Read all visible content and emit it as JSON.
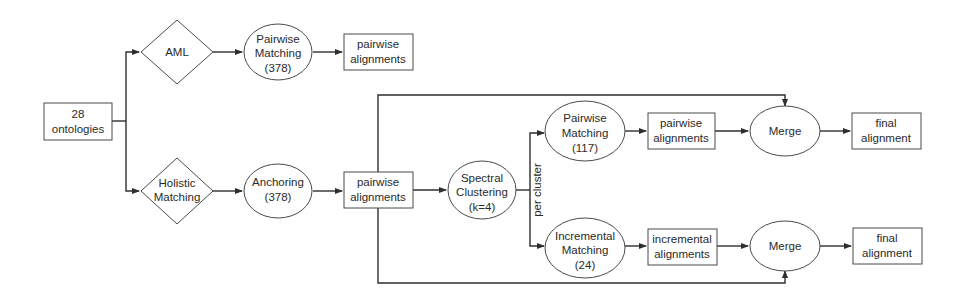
{
  "diagram": {
    "nodes": {
      "input": {
        "lines": [
          "28",
          "ontologies"
        ],
        "shape": "rect"
      },
      "aml": {
        "lines": [
          "AML"
        ],
        "shape": "diamond"
      },
      "pairwise_matching_378": {
        "lines": [
          "Pairwise",
          "Matching",
          "(378)"
        ],
        "shape": "ellipse"
      },
      "pairwise_alignments_top": {
        "lines": [
          "pairwise",
          "alignments"
        ],
        "shape": "rect"
      },
      "holistic": {
        "lines": [
          "Holistic",
          "Matching"
        ],
        "shape": "diamond"
      },
      "anchoring": {
        "lines": [
          "Anchoring",
          "(378)"
        ],
        "shape": "ellipse"
      },
      "pairwise_alignments_mid": {
        "lines": [
          "pairwise",
          "alignments"
        ],
        "shape": "rect"
      },
      "spectral": {
        "lines": [
          "Spectral",
          "Clustering",
          "(k=4)"
        ],
        "shape": "ellipse"
      },
      "pairwise_matching_117": {
        "lines": [
          "Pairwise",
          "Matching",
          "(117)"
        ],
        "shape": "ellipse"
      },
      "pairwise_alignments_cluster": {
        "lines": [
          "pairwise",
          "alignments"
        ],
        "shape": "rect"
      },
      "merge_top": {
        "lines": [
          "Merge"
        ],
        "shape": "ellipse"
      },
      "final_top": {
        "lines": [
          "final",
          "alignment"
        ],
        "shape": "rect"
      },
      "incremental_matching": {
        "lines": [
          "Incremental",
          "Matching",
          "(24)"
        ],
        "shape": "ellipse"
      },
      "incremental_alignments": {
        "lines": [
          "incremental",
          "alignments"
        ],
        "shape": "rect"
      },
      "merge_bottom": {
        "lines": [
          "Merge"
        ],
        "shape": "ellipse"
      },
      "final_bottom": {
        "lines": [
          "final",
          "alignment"
        ],
        "shape": "rect"
      }
    },
    "edge_labels": {
      "per_cluster": "per cluster"
    },
    "edges": [
      [
        "input",
        "aml"
      ],
      [
        "input",
        "holistic"
      ],
      [
        "aml",
        "pairwise_matching_378"
      ],
      [
        "pairwise_matching_378",
        "pairwise_alignments_top"
      ],
      [
        "holistic",
        "anchoring"
      ],
      [
        "anchoring",
        "pairwise_alignments_mid"
      ],
      [
        "pairwise_alignments_mid",
        "spectral"
      ],
      [
        "pairwise_alignments_mid",
        "merge_top"
      ],
      [
        "pairwise_alignments_mid",
        "merge_bottom"
      ],
      [
        "spectral",
        "pairwise_matching_117"
      ],
      [
        "spectral",
        "incremental_matching"
      ],
      [
        "pairwise_matching_117",
        "pairwise_alignments_cluster"
      ],
      [
        "pairwise_alignments_cluster",
        "merge_top"
      ],
      [
        "merge_top",
        "final_top"
      ],
      [
        "incremental_matching",
        "incremental_alignments"
      ],
      [
        "incremental_alignments",
        "merge_bottom"
      ],
      [
        "merge_bottom",
        "final_bottom"
      ]
    ],
    "colors": {
      "stroke": "#4a4a4a",
      "edge": "#2e2e2e",
      "text": "#2a2a2a",
      "background": "#ffffff"
    }
  }
}
